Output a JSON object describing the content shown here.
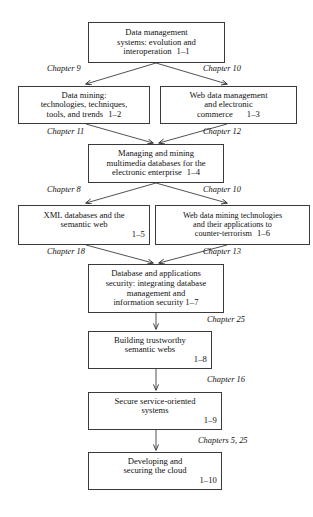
{
  "diagram": {
    "type": "flowchart",
    "title": "",
    "nodes": [
      {
        "id": "1-1",
        "lines": [
          "Data management",
          "systems: evolution and",
          "interoperation"
        ],
        "number": "1–1",
        "number_inline": true
      },
      {
        "id": "1-2",
        "lines": [
          "Data mining:",
          "technologies, techniques,",
          "tools, and trends"
        ],
        "number": "1–2",
        "number_inline": true
      },
      {
        "id": "1-3",
        "lines": [
          "Web data management",
          "and electronic",
          "commerce"
        ],
        "number": "1–3",
        "number_inline": true
      },
      {
        "id": "1-4",
        "lines": [
          "Managing and mining",
          "multimedia databases for the",
          "electronic enterprise"
        ],
        "number": "1–4",
        "number_inline": true
      },
      {
        "id": "1-5",
        "lines": [
          "XML databases and the",
          "semantic web"
        ],
        "number": "1–5",
        "number_inline": false
      },
      {
        "id": "1-6",
        "lines": [
          "Web data mining technologies",
          "and their applications to",
          "counter-terrorism"
        ],
        "number": "1–6",
        "number_inline": true
      },
      {
        "id": "1-7",
        "lines": [
          "Database and applications",
          "security: integrating database",
          "management and",
          "information security"
        ],
        "number": "1–7",
        "number_inline": true
      },
      {
        "id": "1-8",
        "lines": [
          "Building trustworthy",
          "semantic webs"
        ],
        "number": "1–8",
        "number_inline": false
      },
      {
        "id": "1-9",
        "lines": [
          "Secure service-oriented",
          "systems"
        ],
        "number": "1–9",
        "number_inline": false
      },
      {
        "id": "1-10",
        "lines": [
          "Developing and",
          "securing the cloud"
        ],
        "number": "1–10",
        "number_inline": false
      }
    ],
    "edge_labels": [
      {
        "id": "chapter-9",
        "text": "Chapter 9"
      },
      {
        "id": "chapter-10-top",
        "text": "Chapter 10"
      },
      {
        "id": "chapter-11",
        "text": "Chapter 11"
      },
      {
        "id": "chapter-12",
        "text": "Chapter 12"
      },
      {
        "id": "chapter-8",
        "text": "Chapter 8"
      },
      {
        "id": "chapter-10-mid",
        "text": "Chapter 10"
      },
      {
        "id": "chapter-18",
        "text": "Chapter 18"
      },
      {
        "id": "chapter-13",
        "text": "Chapter 13"
      },
      {
        "id": "chapter-25",
        "text": "Chapter 25"
      },
      {
        "id": "chapter-16",
        "text": "Chapter 16"
      },
      {
        "id": "chapters-5-25",
        "text": "Chapters 5, 25"
      }
    ],
    "colors": {
      "box_border": "#3a3a3a",
      "text": "#111111",
      "background": "#ffffff",
      "edge": "#333333"
    }
  }
}
